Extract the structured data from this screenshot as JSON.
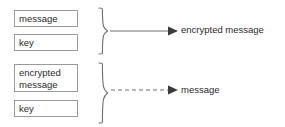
{
  "diagram": {
    "background_color": "#ffffff",
    "line_color": "#6e6e6e",
    "box_border_color": "#9a9a9a",
    "text_color": "#2b2b2b",
    "encryption": {
      "inputs": [
        {
          "label": "message",
          "name": "message-box"
        },
        {
          "label": "key",
          "name": "key-box"
        }
      ],
      "grouping": "brace",
      "connector": {
        "style": "solid",
        "arrowhead": "filled-triangle"
      },
      "output": "encrypted message"
    },
    "decryption": {
      "inputs": [
        {
          "label": "encrypted\nmessage",
          "name": "encrypted-message-box"
        },
        {
          "label": "key",
          "name": "key-box"
        }
      ],
      "grouping": "brace",
      "connector": {
        "style": "dashed",
        "arrowhead": "filled-triangle"
      },
      "output": "message"
    }
  }
}
